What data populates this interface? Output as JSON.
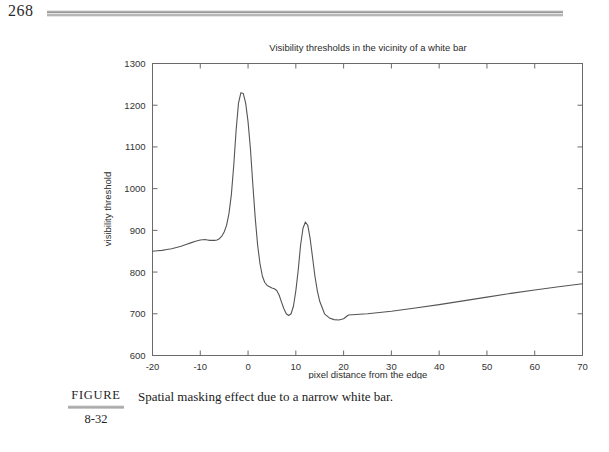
{
  "page": {
    "number": "268"
  },
  "figure": {
    "label_word": "FIGURE",
    "number": "8-32",
    "caption": "Spatial masking effect due to a narrow white bar."
  },
  "chart_data": {
    "type": "line",
    "title": "Visibility thresholds in the vicinity of a white bar",
    "xlabel": "pixel distance from the edge",
    "ylabel": "visibility threshold",
    "xlim": [
      -20,
      70
    ],
    "ylim": [
      600,
      1300
    ],
    "xticks": [
      -20,
      -10,
      0,
      10,
      20,
      30,
      40,
      50,
      60,
      70
    ],
    "yticks": [
      600,
      700,
      800,
      900,
      1000,
      1100,
      1200,
      1300
    ],
    "xtick_labels": [
      "-20",
      "-10",
      "0",
      "10",
      "20",
      "30",
      "40",
      "50",
      "60",
      "70"
    ],
    "ytick_labels": [
      "600",
      "700",
      "800",
      "900",
      "1000",
      "1100",
      "1200",
      "1300"
    ],
    "grid": false,
    "legend": null,
    "line_color": "#555555",
    "series": [
      {
        "name": "visibility threshold",
        "x": [
          -20,
          -19,
          -18,
          -17,
          -16,
          -15,
          -14,
          -13,
          -12,
          -11,
          -10,
          -9,
          -8.5,
          -8,
          -7.5,
          -7,
          -6.5,
          -6,
          -5.5,
          -5,
          -4.5,
          -4,
          -3.5,
          -3,
          -2.5,
          -2,
          -1.5,
          -1,
          -0.5,
          0,
          0.5,
          1,
          1.5,
          2,
          2.5,
          3,
          3.5,
          4,
          4.5,
          5,
          5.5,
          6,
          6.5,
          7,
          7.5,
          8,
          8.5,
          9,
          9.5,
          10,
          10.5,
          11,
          11.5,
          12,
          12.5,
          13,
          13.5,
          14,
          14.5,
          15,
          16,
          17,
          18,
          19,
          20,
          21,
          25,
          30,
          35,
          40,
          45,
          50,
          55,
          60,
          65,
          70
        ],
        "y": [
          850,
          851,
          852,
          854,
          856,
          859,
          862,
          866,
          870,
          874,
          877,
          878,
          877,
          876,
          876,
          876,
          877,
          880,
          886,
          896,
          912,
          940,
          985,
          1055,
          1140,
          1205,
          1230,
          1228,
          1205,
          1160,
          1095,
          1010,
          930,
          865,
          820,
          790,
          775,
          768,
          765,
          762,
          760,
          756,
          745,
          728,
          712,
          700,
          696,
          700,
          718,
          755,
          805,
          865,
          905,
          920,
          912,
          880,
          835,
          790,
          755,
          730,
          700,
          690,
          686,
          685,
          688,
          697,
          700,
          706,
          714,
          722,
          731,
          740,
          749,
          757,
          765,
          772
        ]
      }
    ],
    "annotations": {
      "main_peak": {
        "x": -1.5,
        "y": 1230
      },
      "secondary_peak": {
        "x": 12,
        "y": 920
      },
      "left_plateau_bump": {
        "x": -9,
        "y": 878
      },
      "trough_between_peaks": {
        "x": 8.5,
        "y": 696
      },
      "right_minimum": {
        "x": 19,
        "y": 685
      },
      "right_endpoint": {
        "x": 70,
        "y": 772
      },
      "left_endpoint": {
        "x": -20,
        "y": 850
      }
    }
  }
}
